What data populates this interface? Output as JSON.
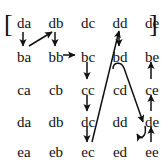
{
  "figure": {
    "ink_color": "#111111",
    "background_color": "#ffffff",
    "left_bracket": "[",
    "right_bracket": "]",
    "rows": [
      {
        "cells": [
          "da",
          "db",
          "dc",
          "dd",
          "de"
        ]
      },
      {
        "cells": [
          "ba",
          "bb",
          "bc",
          "bd",
          "be"
        ]
      },
      {
        "cells": [
          "ca",
          "cb",
          "cc",
          "cd",
          "ce"
        ]
      },
      {
        "cells": [
          "da",
          "db",
          "dc",
          "dd",
          "de"
        ]
      },
      {
        "cells": [
          "ea",
          "eb",
          "ec",
          "ed",
          "ee"
        ]
      }
    ],
    "arrows": [
      {
        "name": "da-to-ba",
        "kind": "straight-down"
      },
      {
        "name": "ba-to-db",
        "kind": "diagonal-up-right"
      },
      {
        "name": "db-to-bb",
        "kind": "straight-down"
      },
      {
        "name": "bb-to-bc",
        "kind": "straight-right"
      },
      {
        "name": "bc-to-cc",
        "kind": "straight-down"
      },
      {
        "name": "cc-to-dc",
        "kind": "straight-down"
      },
      {
        "name": "dc-to-ec",
        "kind": "straight-down"
      },
      {
        "name": "ec-to-dd",
        "kind": "long-diagonal-up-right"
      },
      {
        "name": "dd-to-bd",
        "kind": "straight-down"
      },
      {
        "name": "bd-to-de",
        "kind": "hooked-diagonal-down-right"
      },
      {
        "name": "de-to-ee",
        "kind": "hook-curl"
      },
      {
        "name": "ee-to-de",
        "kind": "straight-up"
      },
      {
        "name": "de-to-ce",
        "kind": "straight-up"
      },
      {
        "name": "ce-to-be",
        "kind": "straight-up"
      }
    ]
  }
}
